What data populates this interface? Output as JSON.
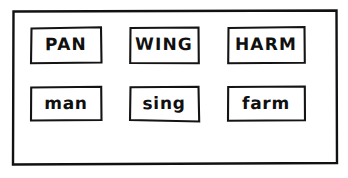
{
  "page": {
    "background_color": "#ffffff",
    "ink_color": "#111111"
  },
  "frame": {
    "name": "outer-hand-drawn-border",
    "style": "hand-drawn rectangle"
  },
  "grid": {
    "rows": 2,
    "columns": 3,
    "cells": [
      {
        "id": "r0c0",
        "text": "PAN",
        "case": "upper",
        "row": 0,
        "column": 0
      },
      {
        "id": "r0c1",
        "text": "WING",
        "case": "upper",
        "row": 0,
        "column": 1
      },
      {
        "id": "r0c2",
        "text": "HARM",
        "case": "upper",
        "row": 0,
        "column": 2
      },
      {
        "id": "r1c0",
        "text": "man",
        "case": "lower",
        "row": 1,
        "column": 0
      },
      {
        "id": "r1c1",
        "text": "sing",
        "case": "lower",
        "row": 1,
        "column": 1
      },
      {
        "id": "r1c2",
        "text": "farm",
        "case": "lower",
        "row": 1,
        "column": 2
      }
    ]
  }
}
